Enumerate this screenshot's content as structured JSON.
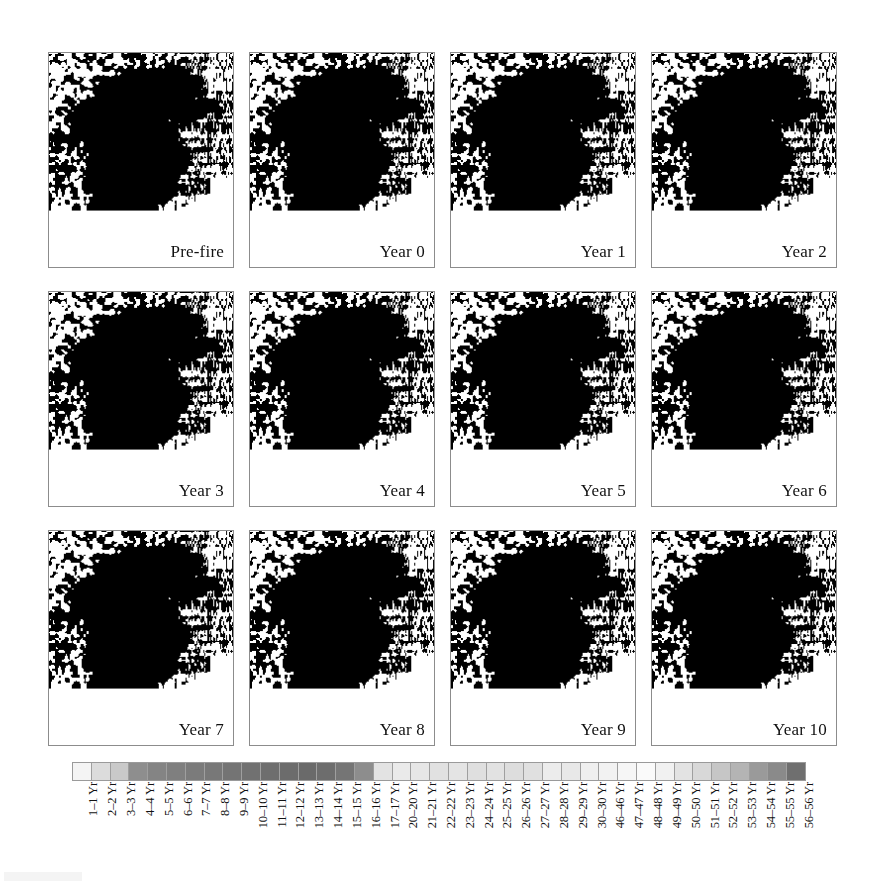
{
  "figure": {
    "kind": "remote-sensing map series",
    "panel_rows": 3,
    "panel_cols": 4
  },
  "panels": [
    {
      "label": "Pre-fire",
      "name": "panel-pre-fire",
      "burn_level": 0.0
    },
    {
      "label": "Year 0",
      "name": "panel-year-0",
      "burn_level": 0.62
    },
    {
      "label": "Year 1",
      "name": "panel-year-1",
      "burn_level": 0.14
    },
    {
      "label": "Year 2",
      "name": "panel-year-2",
      "burn_level": 0.3
    },
    {
      "label": "Year 3",
      "name": "panel-year-3",
      "burn_level": 0.12
    },
    {
      "label": "Year 4",
      "name": "panel-year-4",
      "burn_level": 0.18
    },
    {
      "label": "Year 5",
      "name": "panel-year-5",
      "burn_level": 0.34
    },
    {
      "label": "Year 6",
      "name": "panel-year-6",
      "burn_level": 0.45
    },
    {
      "label": "Year 7",
      "name": "panel-year-7",
      "burn_level": 0.52
    },
    {
      "label": "Year 8",
      "name": "panel-year-8",
      "burn_level": 0.58
    },
    {
      "label": "Year 9",
      "name": "panel-year-9",
      "burn_level": 0.74
    },
    {
      "label": "Year 10",
      "name": "panel-year-10",
      "burn_level": 0.82
    }
  ],
  "legend": {
    "orientation": "horizontal",
    "label_rotation_deg": -90,
    "cells": [
      {
        "label": "1–1 Yr",
        "color": "#f4f4f4"
      },
      {
        "label": "2–2 Yr",
        "color": "#dcdcdc"
      },
      {
        "label": "3–3 Yr",
        "color": "#c9c9c9"
      },
      {
        "label": "4–4 Yr",
        "color": "#8e8e8e"
      },
      {
        "label": "5–5 Yr",
        "color": "#848484"
      },
      {
        "label": "6–6 Yr",
        "color": "#7f7f7f"
      },
      {
        "label": "7–7 Yr",
        "color": "#7b7b7b"
      },
      {
        "label": "8–8 Yr",
        "color": "#787878"
      },
      {
        "label": "9–9 Yr",
        "color": "#747474"
      },
      {
        "label": "10–10 Yr",
        "color": "#717171"
      },
      {
        "label": "11–11 Yr",
        "color": "#6e6e6e"
      },
      {
        "label": "12–12 Yr",
        "color": "#6c6c6c"
      },
      {
        "label": "13–13 Yr",
        "color": "#6a6a6a"
      },
      {
        "label": "14–14 Yr",
        "color": "#6d6d6d"
      },
      {
        "label": "15–15 Yr",
        "color": "#757575"
      },
      {
        "label": "16–16 Yr",
        "color": "#8d8d8d"
      },
      {
        "label": "17–17 Yr",
        "color": "#e3e3e3"
      },
      {
        "label": "20–20 Yr",
        "color": "#eaeaea"
      },
      {
        "label": "21–21 Yr",
        "color": "#e6e6e6"
      },
      {
        "label": "22–22 Yr",
        "color": "#e1e1e1"
      },
      {
        "label": "23–23 Yr",
        "color": "#e4e4e4"
      },
      {
        "label": "24–24 Yr",
        "color": "#dfdfdf"
      },
      {
        "label": "25–25 Yr",
        "color": "#e2e2e2"
      },
      {
        "label": "26–26 Yr",
        "color": "#dddddd"
      },
      {
        "label": "27–27 Yr",
        "color": "#e0e0e0"
      },
      {
        "label": "28–28 Yr",
        "color": "#ececec"
      },
      {
        "label": "29–29 Yr",
        "color": "#e8e8e8"
      },
      {
        "label": "30–30 Yr",
        "color": "#efefef"
      },
      {
        "label": "46–46 Yr",
        "color": "#f2f2f2"
      },
      {
        "label": "47–47 Yr",
        "color": "#f6f6f6"
      },
      {
        "label": "48–48 Yr",
        "color": "#fafafa"
      },
      {
        "label": "49–49 Yr",
        "color": "#f1f1f1"
      },
      {
        "label": "50–50 Yr",
        "color": "#e3e3e3"
      },
      {
        "label": "51–51 Yr",
        "color": "#d8d8d8"
      },
      {
        "label": "52–52 Yr",
        "color": "#c6c6c6"
      },
      {
        "label": "53–53 Yr",
        "color": "#b4b4b4"
      },
      {
        "label": "54–54 Yr",
        "color": "#9a9a9a"
      },
      {
        "label": "55–55 Yr",
        "color": "#8a8a8a"
      },
      {
        "label": "56–56 Yr",
        "color": "#6f6f6f"
      }
    ]
  }
}
